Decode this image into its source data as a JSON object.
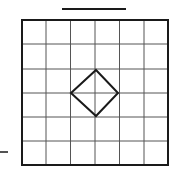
{
  "diagram": {
    "type": "grid-with-diamond",
    "grid": {
      "rows": 6,
      "cols": 6,
      "x": 22,
      "y": 20,
      "width": 146,
      "height": 145,
      "border_color": "#1a1a1a",
      "line_color": "#555555"
    },
    "diamond": {
      "points": [
        [
          96,
          70
        ],
        [
          118,
          93
        ],
        [
          96,
          116
        ],
        [
          71,
          93
        ]
      ],
      "stroke": "#1a1a1a"
    },
    "top_bar": {
      "x1": 62,
      "y1": 9,
      "x2": 126,
      "y2": 9
    },
    "left_dash": {
      "x1": 0,
      "y1": 152,
      "x2": 8,
      "y2": 152
    }
  }
}
